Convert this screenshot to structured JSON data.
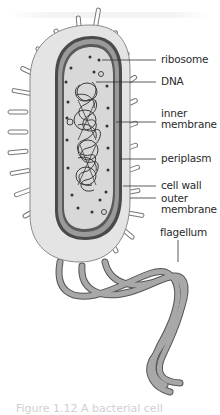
{
  "figure": {
    "labels": [
      {
        "id": "ribosome",
        "text": "ribosome"
      },
      {
        "id": "dna",
        "text": "DNA"
      },
      {
        "id": "inner-membrane",
        "text": "inner\nmembrane"
      },
      {
        "id": "periplasm",
        "text": "periplasm"
      },
      {
        "id": "cell-wall",
        "text": "cell wall"
      },
      {
        "id": "outer-membrane",
        "text": "outer\nmembrane"
      },
      {
        "id": "flagellum",
        "text": "flagellum"
      }
    ],
    "caption": "Figure 1.12 A bacterial cell"
  },
  "colors": {
    "background": "#ffffff",
    "capsule_fill": "#e4e4e4",
    "capsule_stroke": "#8a8a8a",
    "cell_wall": "#4a4a4a",
    "periplasm": "#9a9a9a",
    "cytoplasm": "#d8d8d8",
    "dna": "#3a3a3a",
    "flagellum_fill": "#a8a8a8",
    "flagellum_stroke": "#555555",
    "pili": "#ffffff",
    "label_text": "#2a2a2a",
    "leader_line": "#333333"
  }
}
